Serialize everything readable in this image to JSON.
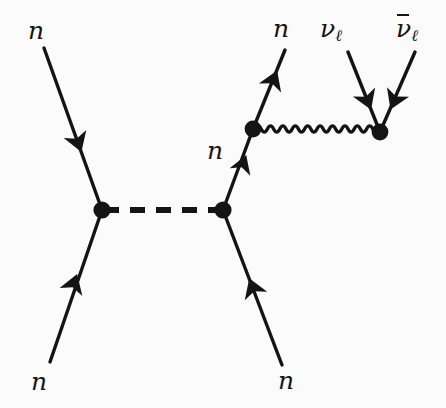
{
  "figure": {
    "kind": "feynman-diagram",
    "title": "",
    "background_color": "#fbfbfb",
    "line_color": "#141414"
  },
  "labels": {
    "incoming_neutron_upper_left": "n",
    "incoming_neutron_lower_left": "n",
    "internal_neutron": "n",
    "outgoing_neutron_upper_right": "n",
    "outgoing_neutron_lower_right": "n",
    "neutrino": "ν",
    "neutrino_subscript": "ℓ",
    "antineutrino": "ν",
    "antineutrino_subscript": "ℓ"
  },
  "vertices": [
    {
      "name": "left-vertex",
      "x": 102,
      "y": 210
    },
    {
      "name": "right-vertex",
      "x": 223,
      "y": 210
    },
    {
      "name": "weak-emission-vertex",
      "x": 253,
      "y": 129
    },
    {
      "name": "neutrino-pair-vertex",
      "x": 380,
      "y": 132
    }
  ],
  "propagators": [
    {
      "name": "scalar-mediator",
      "style": "dashed",
      "from": "left-vertex",
      "to": "right-vertex"
    },
    {
      "name": "weak-boson",
      "style": "wavy",
      "from": "weak-emission-vertex",
      "to": "neutrino-pair-vertex"
    }
  ],
  "fermion_lines": [
    {
      "name": "incoming-neutron-upper-left",
      "style": "solid",
      "arrow": "toward-vertex"
    },
    {
      "name": "incoming-neutron-lower-left",
      "style": "solid",
      "arrow": "toward-vertex"
    },
    {
      "name": "outgoing-neutron-lower-right",
      "style": "solid",
      "arrow": "toward-vertex"
    },
    {
      "name": "internal-neutron",
      "style": "solid",
      "arrow": "upward"
    },
    {
      "name": "outgoing-neutron-upper-right",
      "style": "solid",
      "arrow": "outward"
    },
    {
      "name": "neutrino-line",
      "style": "solid",
      "arrow": "toward-vertex"
    },
    {
      "name": "antineutrino-line",
      "style": "solid",
      "arrow": "toward-vertex"
    }
  ]
}
